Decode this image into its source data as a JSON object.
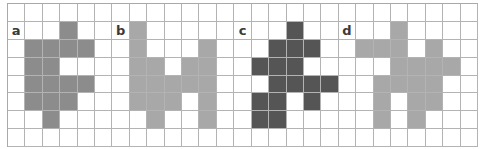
{
  "grid": {
    "cols": 27,
    "rows": 8
  },
  "panels": [
    {
      "label": "a",
      "label_cell": [
        1,
        0
      ],
      "color": "#8c8c8c",
      "cells": [
        [
          1,
          3
        ],
        [
          2,
          1
        ],
        [
          2,
          2
        ],
        [
          2,
          3
        ],
        [
          2,
          4
        ],
        [
          3,
          1
        ],
        [
          3,
          2
        ],
        [
          4,
          1
        ],
        [
          4,
          2
        ],
        [
          4,
          3
        ],
        [
          4,
          4
        ],
        [
          5,
          1
        ],
        [
          5,
          2
        ],
        [
          5,
          3
        ],
        [
          6,
          2
        ]
      ]
    },
    {
      "label": "b",
      "label_cell": [
        1,
        6
      ],
      "color": "#a8a8a8",
      "cells": [
        [
          1,
          7
        ],
        [
          2,
          7
        ],
        [
          2,
          11
        ],
        [
          3,
          7
        ],
        [
          3,
          8
        ],
        [
          3,
          10
        ],
        [
          3,
          11
        ],
        [
          4,
          7
        ],
        [
          4,
          8
        ],
        [
          4,
          9
        ],
        [
          4,
          10
        ],
        [
          4,
          11
        ],
        [
          5,
          7
        ],
        [
          5,
          8
        ],
        [
          5,
          9
        ],
        [
          5,
          11
        ],
        [
          6,
          8
        ],
        [
          6,
          11
        ]
      ]
    },
    {
      "label": "c",
      "label_cell": [
        1,
        13
      ],
      "color": "#555555",
      "cells": [
        [
          1,
          16
        ],
        [
          2,
          15
        ],
        [
          2,
          16
        ],
        [
          2,
          17
        ],
        [
          3,
          14
        ],
        [
          3,
          15
        ],
        [
          3,
          16
        ],
        [
          4,
          15
        ],
        [
          4,
          16
        ],
        [
          4,
          17
        ],
        [
          4,
          18
        ],
        [
          5,
          14
        ],
        [
          5,
          15
        ],
        [
          5,
          17
        ],
        [
          6,
          14
        ],
        [
          6,
          15
        ]
      ]
    },
    {
      "label": "d",
      "label_cell": [
        1,
        19
      ],
      "color": "#a8a8a8",
      "cells": [
        [
          1,
          22
        ],
        [
          2,
          20
        ],
        [
          2,
          21
        ],
        [
          2,
          22
        ],
        [
          2,
          24
        ],
        [
          3,
          22
        ],
        [
          3,
          23
        ],
        [
          3,
          24
        ],
        [
          3,
          25
        ],
        [
          4,
          21
        ],
        [
          4,
          22
        ],
        [
          4,
          23
        ],
        [
          4,
          24
        ],
        [
          5,
          21
        ],
        [
          5,
          23
        ],
        [
          5,
          24
        ],
        [
          6,
          21
        ],
        [
          6,
          23
        ]
      ]
    }
  ]
}
